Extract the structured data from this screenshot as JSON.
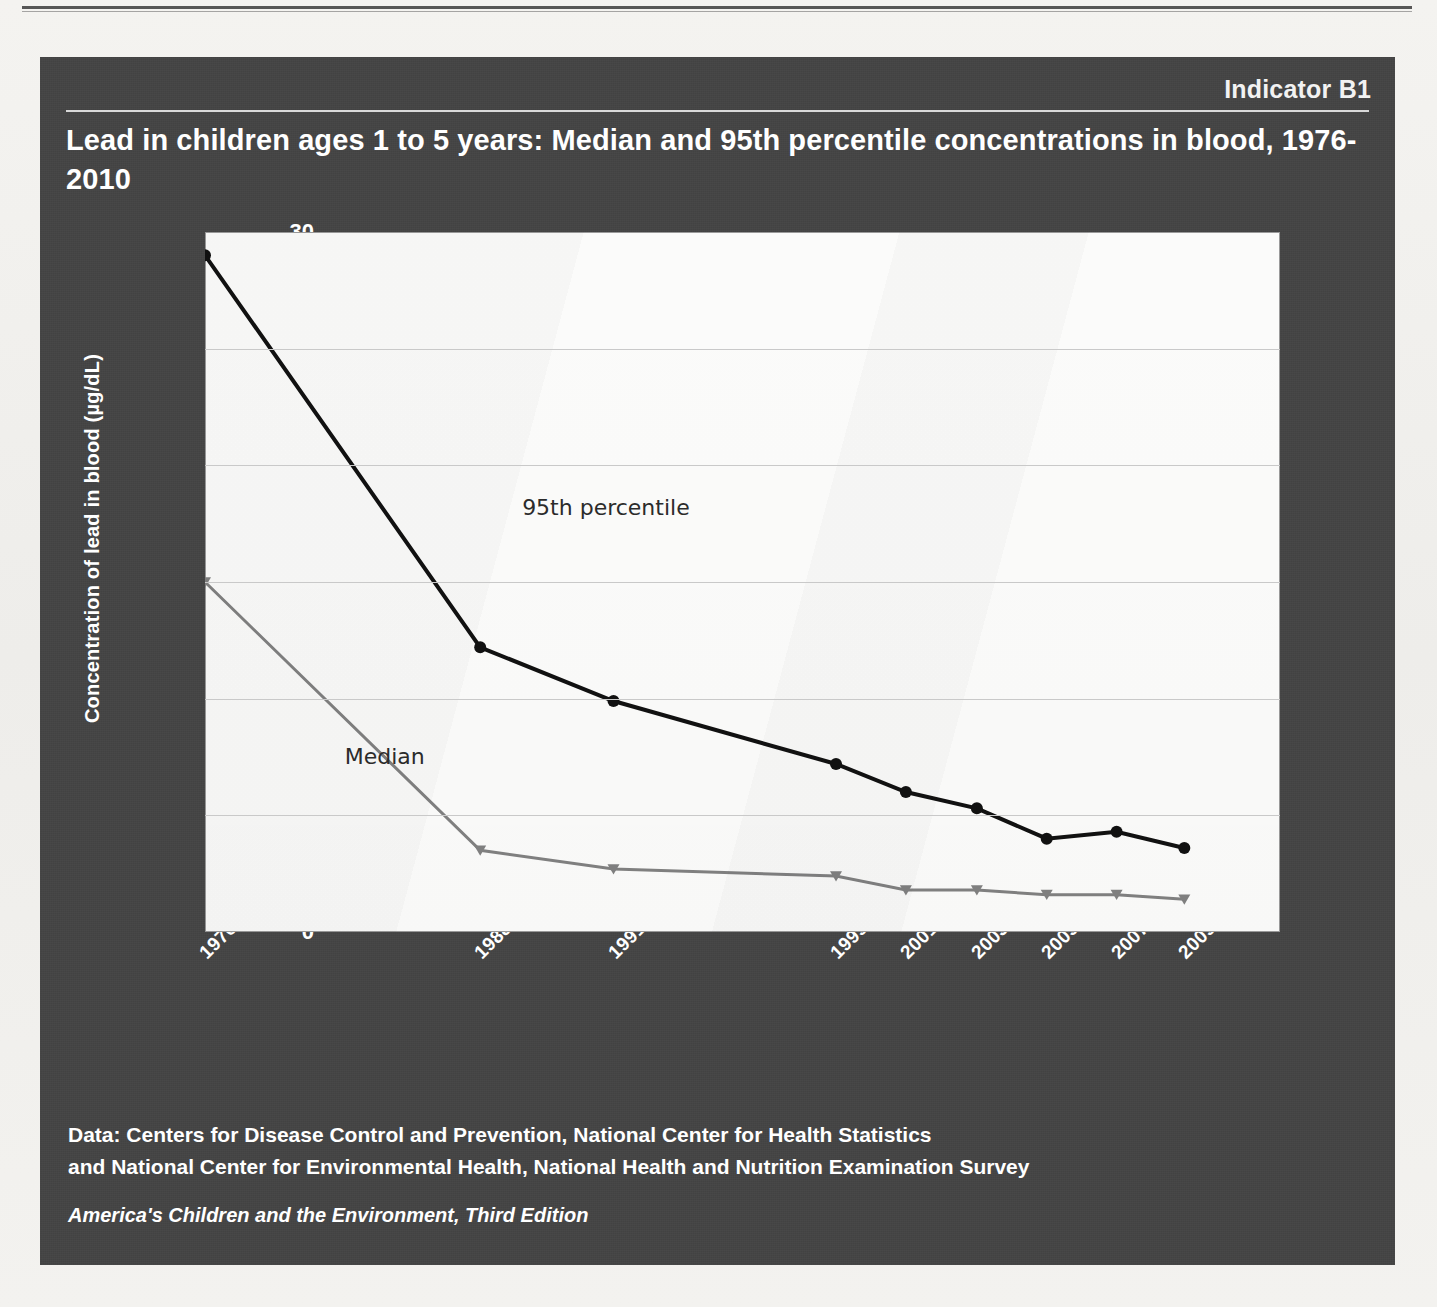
{
  "header": {
    "indicator": "Indicator B1",
    "title": "Lead in children ages 1 to 5 years: Median and 95th percentile concentrations in blood, 1976-2010"
  },
  "footer": {
    "source_line1": "Data: Centers for Disease Control and Prevention, National Center for Health Statistics",
    "source_line2": "and National Center for Environmental Health, National Health and Nutrition Examination Survey",
    "publication": "America's Children and the Environment, Third Edition"
  },
  "colors": {
    "panel_background": "#444444",
    "plot_background": "#fbfbfa",
    "page_background": "#f2f1ee",
    "series_95th": "#111111",
    "series_median": "#808080",
    "gridline": "#c9c9c9",
    "text_light": "#ffffff",
    "text_dark": "#2b2b2b"
  },
  "chart_data": {
    "type": "line",
    "title": "Lead in children ages 1 to 5 years: Median and 95th percentile concentrations in blood, 1976-2010",
    "xlabel": "",
    "ylabel": "Concentration of lead in blood (µg/dL)",
    "ylim": [
      0,
      30
    ],
    "yticks": [
      0,
      5,
      10,
      15,
      20,
      25,
      30
    ],
    "grid": true,
    "legend": "inline-annotations",
    "categories": [
      "1976-1980",
      "1988-1991",
      "1991-1994",
      "1999-2000",
      "2001-2002",
      "2003-2004",
      "2005-2006",
      "2007-2008",
      "2009-2010"
    ],
    "x_positions": [
      0.0,
      0.256,
      0.38,
      0.587,
      0.652,
      0.718,
      0.783,
      0.848,
      0.911
    ],
    "series": [
      {
        "name": "95th percentile",
        "color": "#111111",
        "marker": "circle",
        "values": [
          29.0,
          12.2,
          9.9,
          7.2,
          6.0,
          5.3,
          4.0,
          4.3,
          3.6
        ]
      },
      {
        "name": "Median",
        "color": "#808080",
        "marker": "triangle",
        "values": [
          15.0,
          3.5,
          2.7,
          2.4,
          1.8,
          1.8,
          1.6,
          1.6,
          1.4
        ]
      }
    ],
    "annotations": [
      {
        "text": "95th percentile",
        "x_frac": 0.295,
        "y_value": 18.1
      },
      {
        "text": "Median",
        "x_frac": 0.13,
        "y_value": 7.4
      }
    ]
  }
}
